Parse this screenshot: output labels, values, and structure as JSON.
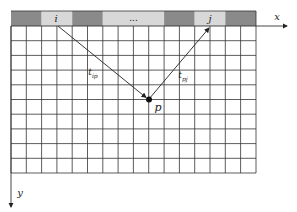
{
  "diagram": {
    "type": "ray-path grid diagram",
    "axes": {
      "x_label": "x",
      "y_label": "y"
    },
    "top_bar": {
      "cells": [
        {
          "label": "",
          "shade": "dark"
        },
        {
          "label": "i",
          "shade": "light"
        },
        {
          "label": "",
          "shade": "dark"
        },
        {
          "label": "...",
          "shade": "light"
        },
        {
          "label": "",
          "shade": "dark"
        },
        {
          "label": "j",
          "shade": "light"
        },
        {
          "label": "",
          "shade": "dark"
        }
      ]
    },
    "grid": {
      "columns": 16,
      "rows": 10
    },
    "point": {
      "label": "p"
    },
    "paths": [
      {
        "from": "i",
        "to": "p",
        "label": "t",
        "subscript": "ip"
      },
      {
        "from": "p",
        "to": "j",
        "label": "t",
        "subscript": "pj"
      }
    ],
    "colors": {
      "dark_cell": "#8a8a8a",
      "light_cell": "#d8d8d8",
      "grid_line": "#333333",
      "background": "#ffffff"
    }
  }
}
